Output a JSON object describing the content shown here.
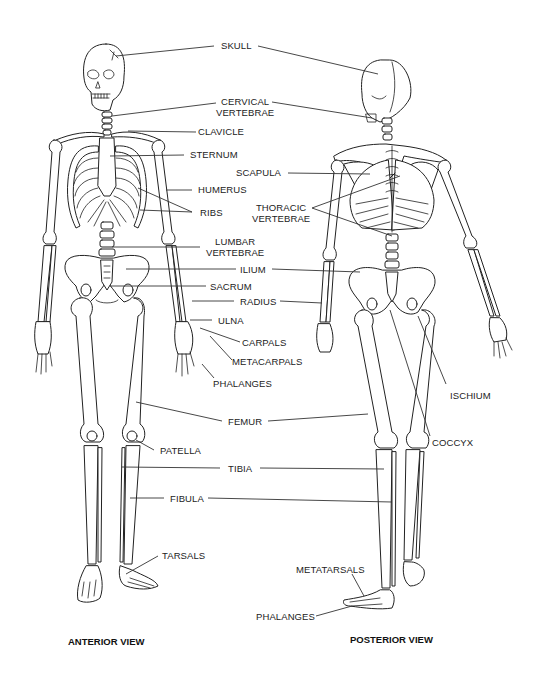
{
  "figure": {
    "views": {
      "anterior": "ANTERIOR VIEW",
      "posterior": "POSTERIOR VIEW"
    },
    "labels": {
      "skull": "SKULL",
      "cervical_vertebrae": [
        "CERVICAL",
        "VERTEBRAE"
      ],
      "clavicle": "CLAVICLE",
      "sternum": "STERNUM",
      "scapula": "SCAPULA",
      "humerus": "HUMERUS",
      "ribs": "RIBS",
      "thoracic_vertebrae": [
        "THORACIC",
        "VERTEBRAE"
      ],
      "lumbar_vertebrae": [
        "LUMBAR",
        "VERTEBRAE"
      ],
      "ilium": "ILIUM",
      "sacrum": "SACRUM",
      "radius": "RADIUS",
      "ulna": "ULNA",
      "carpals": "CARPALS",
      "metacarpals": "METACARPALS",
      "phalanges_hand": "PHALANGES",
      "ischium": "ISCHIUM",
      "femur": "FEMUR",
      "coccyx": "COCCYX",
      "patella": "PATELLA",
      "tibia": "TIBIA",
      "fibula": "FIBULA",
      "tarsals": "TARSALS",
      "metatarsals": "METATARSALS",
      "phalanges_foot": "PHALANGES"
    }
  }
}
